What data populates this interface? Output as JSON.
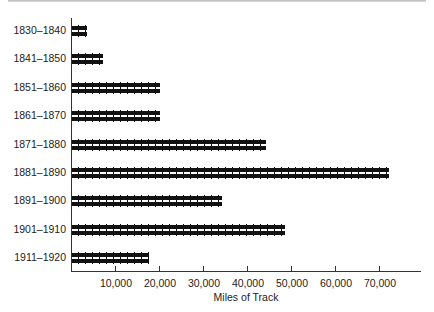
{
  "chart_data": {
    "type": "bar",
    "orientation": "horizontal",
    "title": "",
    "xlabel": "Miles of Track",
    "ylabel": "",
    "categories": [
      "1830–1840",
      "1841–1850",
      "1851–1860",
      "1861–1870",
      "1871–1880",
      "1881–1890",
      "1891–1900",
      "1901–1910",
      "1911–1920"
    ],
    "values": [
      3300,
      7000,
      20000,
      20000,
      44000,
      72000,
      34000,
      48500,
      17500
    ],
    "xticks": [
      "10,000",
      "20,000",
      "30,000",
      "40,000",
      "50,000",
      "60,000",
      "70,000"
    ],
    "xtick_values": [
      10000,
      20000,
      30000,
      40000,
      50000,
      60000,
      70000
    ],
    "xlim": [
      0,
      79000
    ],
    "grid": false,
    "legend": null,
    "bar_style": "railroad-track pictograph",
    "bar_color": "#111111"
  }
}
